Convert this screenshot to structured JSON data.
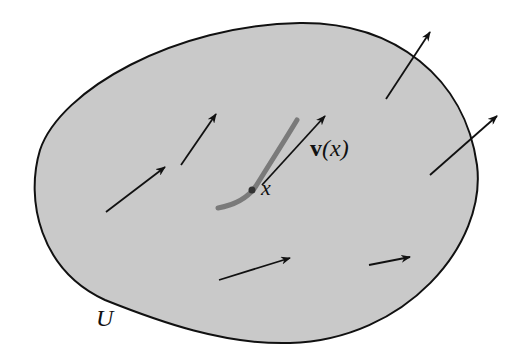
{
  "figure": {
    "region": {
      "label": "U",
      "fill_color": "#c9c9c9",
      "stroke_color": "#111111",
      "path": "M 300 23 C 395 22 465 78 477 165 C 487 245 405 340 290 343 C 225 345 160 322 105 300 C 40 270 25 200 40 150 C 60 90 175 25 300 23 Z"
    },
    "curve": {
      "name": "integral-curve",
      "color": "#7a7a7a",
      "width": 5,
      "path": "M 218 208 C 235 205 248 198 256 186 C 272 160 285 140 297 120"
    },
    "point": {
      "label": "x",
      "cx": 252,
      "cy": 190,
      "r": 3.5
    },
    "tangent_label": {
      "bold_part": "v",
      "rest": "(x)"
    },
    "arrows": [
      {
        "id": "field-arrow-1",
        "x1": 106,
        "y1": 212,
        "x2": 165,
        "y2": 167
      },
      {
        "id": "field-arrow-2",
        "x1": 181,
        "y1": 165,
        "x2": 216,
        "y2": 114
      },
      {
        "id": "field-arrow-3",
        "x1": 386,
        "y1": 99,
        "x2": 430,
        "y2": 32
      },
      {
        "id": "field-arrow-4",
        "x1": 430,
        "y1": 175,
        "x2": 497,
        "y2": 116
      },
      {
        "id": "field-arrow-5",
        "x1": 219,
        "y1": 280,
        "x2": 290,
        "y2": 258
      },
      {
        "id": "field-arrow-6",
        "x1": 369,
        "y1": 265,
        "x2": 410,
        "y2": 257
      },
      {
        "id": "tangent-arrow-v",
        "x1": 262,
        "y1": 185,
        "x2": 325,
        "y2": 116
      }
    ],
    "arrow_color": "#111111"
  }
}
